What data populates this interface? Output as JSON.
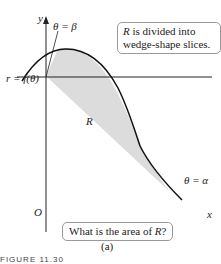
{
  "figure": {
    "axes": {
      "x_label": "x",
      "y_label": "y",
      "origin_label": "O"
    },
    "curve_label": "r = f(θ)",
    "region_label": "R",
    "angle_labels": {
      "beta": "θ = β",
      "alpha": "θ = α"
    },
    "callout_top": {
      "lead": "R",
      "text": " is divided into wedge-shape slices."
    },
    "callout_bottom": {
      "text": "What is the area of ",
      "var": "R",
      "end": "?"
    },
    "caption": "(a)",
    "figure_number": "FIGURE 11.30"
  },
  "colors": {
    "region_fill": "#dcdcdc",
    "line": "#222222",
    "callout_border": "#9a9a9a"
  }
}
